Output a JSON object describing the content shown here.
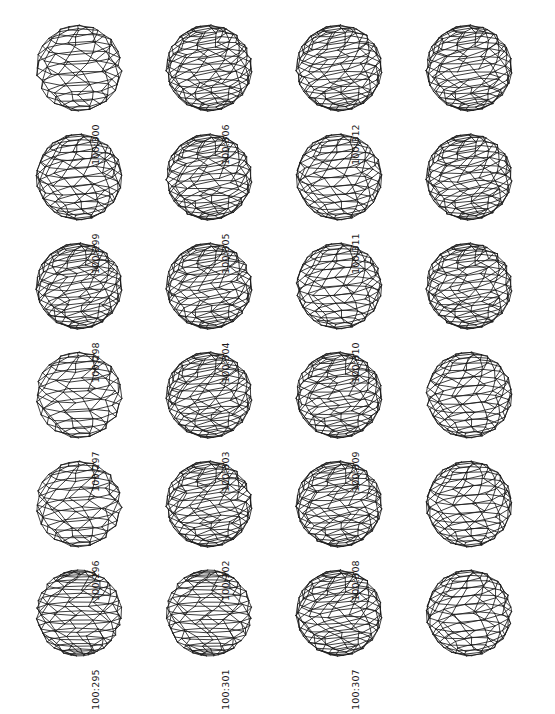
{
  "plate": {
    "background_color": "#ffffff",
    "line_color": "#1b1b1b",
    "columns": 4,
    "rows": 6,
    "total_figures": 24
  },
  "figures": [
    {
      "label": "100:294",
      "column": 1,
      "row": 1,
      "style": "coarse",
      "seed": 294
    },
    {
      "label": "100:300",
      "column": 2,
      "row": 1,
      "style": "fine",
      "seed": 300
    },
    {
      "label": "100:306",
      "column": 3,
      "row": 1,
      "style": "fine",
      "seed": 306
    },
    {
      "label": "100:312",
      "column": 4,
      "row": 1,
      "style": "fine",
      "seed": 312
    },
    {
      "label": "100:293",
      "column": 1,
      "row": 2,
      "style": "medium",
      "seed": 293
    },
    {
      "label": "100:299",
      "column": 2,
      "row": 2,
      "style": "fine",
      "seed": 299
    },
    {
      "label": "100:305",
      "column": 3,
      "row": 2,
      "style": "medium",
      "seed": 305
    },
    {
      "label": "100:311",
      "column": 4,
      "row": 2,
      "style": "fine",
      "seed": 311
    },
    {
      "label": "100:292",
      "column": 1,
      "row": 3,
      "style": "fine",
      "seed": 292
    },
    {
      "label": "100:298",
      "column": 2,
      "row": 3,
      "style": "fine",
      "seed": 298
    },
    {
      "label": "100:304",
      "column": 3,
      "row": 3,
      "style": "medium",
      "seed": 304
    },
    {
      "label": "100:310",
      "column": 4,
      "row": 3,
      "style": "fine",
      "seed": 310
    },
    {
      "label": "100:291",
      "column": 1,
      "row": 4,
      "style": "coarse",
      "seed": 291
    },
    {
      "label": "100:297",
      "column": 2,
      "row": 4,
      "style": "fine",
      "seed": 297
    },
    {
      "label": "100:303",
      "column": 3,
      "row": 4,
      "style": "fine",
      "seed": 303
    },
    {
      "label": "100:309",
      "column": 4,
      "row": 4,
      "style": "medium",
      "seed": 309
    },
    {
      "label": "100:290",
      "column": 1,
      "row": 5,
      "style": "coarse",
      "seed": 290
    },
    {
      "label": "100:296",
      "column": 2,
      "row": 5,
      "style": "fine",
      "seed": 296
    },
    {
      "label": "100:302",
      "column": 3,
      "row": 5,
      "style": "fine",
      "seed": 302
    },
    {
      "label": "100:308",
      "column": 4,
      "row": 5,
      "style": "medium",
      "seed": 308
    },
    {
      "label": "100:289",
      "column": 1,
      "row": 6,
      "style": "ring",
      "seed": 289
    },
    {
      "label": "100:295",
      "column": 2,
      "row": 6,
      "style": "ring",
      "seed": 295
    },
    {
      "label": "100:301",
      "column": 3,
      "row": 6,
      "style": "fine",
      "seed": 301
    },
    {
      "label": "100:307",
      "column": 4,
      "row": 6,
      "style": "medium",
      "seed": 307
    }
  ]
}
